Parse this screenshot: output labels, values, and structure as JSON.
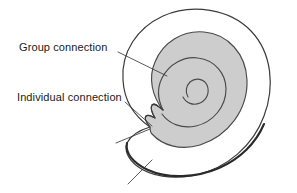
{
  "figure": {
    "name": "spiral-shell-connection-diagram",
    "width": 297,
    "height": 193,
    "background_color": "#ffffff"
  },
  "labels": [
    {
      "id": "group-connection",
      "text": "Group connection",
      "x": 19,
      "y": 41,
      "leader_from": [
        118,
        52
      ],
      "leader_to": [
        167,
        76
      ]
    },
    {
      "id": "individual-connection",
      "text": "Individual connection",
      "x": 17,
      "y": 91,
      "leader_from": [
        125,
        102
      ],
      "leader_to": [
        152,
        126
      ]
    }
  ],
  "leaders": [
    {
      "id": "group-connection-leader",
      "from": [
        118,
        52
      ],
      "to": [
        167,
        76
      ]
    },
    {
      "id": "individual-connection-leader",
      "from": [
        125,
        102
      ],
      "to": [
        152,
        126
      ]
    },
    {
      "id": "unlabeled-aperture-leader",
      "from": [
        116,
        143
      ],
      "to": [
        150,
        129
      ]
    },
    {
      "id": "unlabeled-outer-edge-leader",
      "from": [
        128,
        184
      ],
      "to": [
        152,
        160
      ]
    }
  ],
  "shapes": {
    "outer_shell": {
      "name": "outer-spiral-band",
      "fill": "#ffffff",
      "stroke": "#3b3b3b",
      "stroke_width": 1.1
    },
    "inner_band": {
      "name": "inner-gray-spiral-band",
      "fill": "#cdcdcd",
      "stroke": "#4a4a4a",
      "stroke_width": 1.1
    },
    "aperture_notch": {
      "name": "aperture-notch",
      "stroke": "#3b3b3b"
    },
    "spiral_center": {
      "x": 197,
      "y": 82
    },
    "bottom_edge": {
      "name": "shell-bottom-thick-edge",
      "stroke": "#2a2a2a",
      "stroke_width": 2.2
    }
  },
  "colors": {
    "gray_fill": "#cdcdcd",
    "line": "#3b3b3b",
    "text": "#1a1a1a",
    "background": "#ffffff"
  }
}
